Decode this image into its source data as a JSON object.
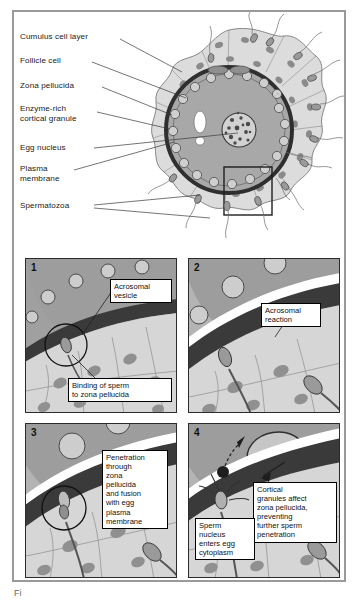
{
  "figure": {
    "title_fragment": "Fi",
    "border_color": "#9a9a9a"
  },
  "colors": {
    "cytoplasm": "#a8a8a8",
    "zona_pellucida": "#3a3a3a",
    "cumulus": "#d8d8d8",
    "cell_nucleus": "#8a8a8a",
    "granule_fill": "#c9c9c9",
    "panel_bg": "#b0b0b0",
    "textbox_bg": "#ffffff",
    "line": "#2b2b2b"
  },
  "top_diagram": {
    "name": "mammalian-egg-with-sperm",
    "labels": [
      {
        "id": "cumulus-cell-layer",
        "text": "Cumulus cell layer",
        "x": 6,
        "y": 24
      },
      {
        "id": "follicle-cell",
        "text": "Follicle cell",
        "x": 6,
        "y": 47
      },
      {
        "id": "zona-pellucida",
        "text": "Zona pellucida",
        "x": 6,
        "y": 72
      },
      {
        "id": "enzyme-rich-cortical-granule",
        "text": "Enzyme-rich\ncortical granule",
        "x": 6,
        "y": 97
      },
      {
        "id": "egg-nucleus",
        "text": "Egg nucleus",
        "x": 6,
        "y": 132
      },
      {
        "id": "plasma-membrane",
        "text": "Plasma\nmembrane",
        "x": 6,
        "y": 155
      },
      {
        "id": "spermatozoa",
        "text": "Spermatozoa",
        "x": 6,
        "y": 190
      }
    ]
  },
  "panels": [
    {
      "number": "1",
      "name": "panel-binding",
      "textboxes": [
        {
          "id": "acrosomal-vesicle",
          "text": "Acrosomal\nvesicle",
          "x": 86,
          "y": 22,
          "w": 60
        },
        {
          "id": "binding-of-sperm",
          "text": "Binding of sperm\nto zona pellucida",
          "x": 44,
          "y": 121,
          "w": 101
        }
      ]
    },
    {
      "number": "2",
      "name": "panel-acrosomal-reaction",
      "textboxes": [
        {
          "id": "acrosomal-reaction",
          "text": "Acrosomal\nreaction",
          "x": 74,
          "y": 46,
          "w": 58
        }
      ]
    },
    {
      "number": "3",
      "name": "panel-penetration",
      "textboxes": [
        {
          "id": "penetration-through-zona",
          "text": "Penetration\nthrough\nzona\npellucida\nand fusion\nwith egg\nplasma\nmembrane",
          "x": 78,
          "y": 28,
          "w": 62
        }
      ]
    },
    {
      "number": "4",
      "name": "panel-cortical-reaction",
      "textboxes": [
        {
          "id": "cortical-granules-affect",
          "text": "Cortical\ngranules affect\nzona pellucida,\npreventing\nfurther sperm\npenetration",
          "x": 66,
          "y": 60,
          "w": 82
        },
        {
          "id": "sperm-nucleus-enters",
          "text": "Sperm\nnucleus\nenters egg\ncytoplasm",
          "x": 8,
          "y": 96,
          "w": 57
        }
      ]
    }
  ]
}
